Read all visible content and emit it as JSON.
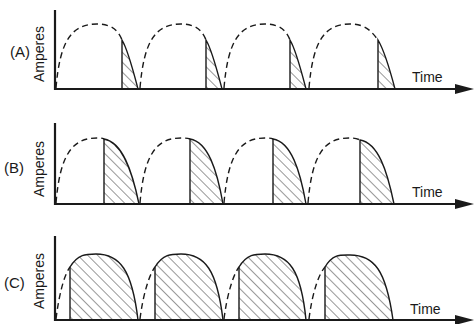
{
  "panels": [
    {
      "id": "A",
      "label": "(A)",
      "ylabel": "Amperes",
      "xlabel": "Time",
      "conduction_description": "small hatched tail after late cut-in"
    },
    {
      "id": "B",
      "label": "(B)",
      "ylabel": "Amperes",
      "xlabel": "Time",
      "conduction_description": "hatched region from peak to zero"
    },
    {
      "id": "C",
      "label": "(C)",
      "ylabel": "Amperes",
      "xlabel": "Time",
      "conduction_description": "hatched region from early cut-in to zero"
    }
  ],
  "colors": {
    "line": "#1a1a1a",
    "background": "#ffffff"
  }
}
